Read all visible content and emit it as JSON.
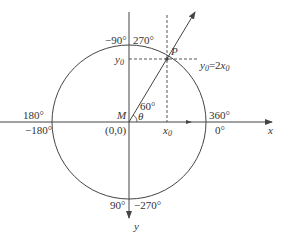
{
  "diagram": {
    "type": "unit-circle-coordinate-mapping",
    "colors": {
      "stroke": "#444444",
      "text": "#333333",
      "background": "#ffffff"
    },
    "center": {
      "label": "M",
      "coord_label": "(0,0)"
    },
    "axes": {
      "x_label": "x",
      "y_label": "y"
    },
    "point": {
      "label": "P",
      "equation": "y0=2x0"
    },
    "projections": {
      "x_label": "x0",
      "y_label": "y0"
    },
    "angles": {
      "ray_angle": "60°",
      "theta": "θ"
    },
    "degree_labels": {
      "top_left": "−90°",
      "top_right": "270°",
      "left_upper": "180°",
      "left_lower": "−180°",
      "right_upper": "360°",
      "right_lower": "0°",
      "bottom_left": "90°",
      "bottom_right": "−270°"
    }
  }
}
